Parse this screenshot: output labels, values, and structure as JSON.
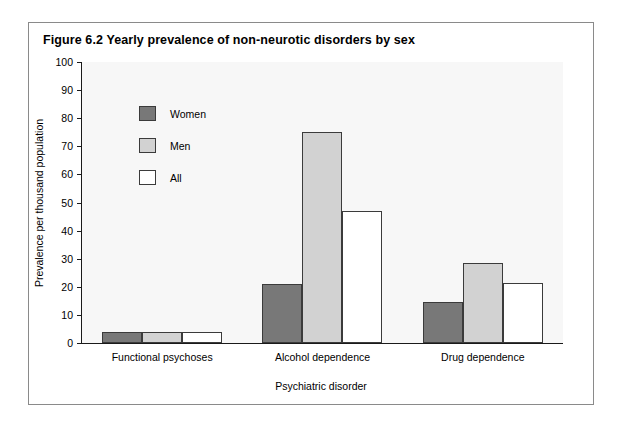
{
  "figure": {
    "title": "Figure 6.2  Yearly prevalence of non-neurotic disorders by sex"
  },
  "chart_data": {
    "type": "bar",
    "title": "Figure 6.2  Yearly prevalence of non-neurotic disorders by sex",
    "xlabel": "Psychiatric disorder",
    "ylabel": "Prevalence per thousand population",
    "categories": [
      "Functional psychoses",
      "Alcohol dependence",
      "Drug dependence"
    ],
    "series": [
      {
        "name": "Women",
        "color": "#787878",
        "values": [
          4,
          21,
          14.5
        ]
      },
      {
        "name": "Men",
        "color": "#d2d2d2",
        "values": [
          4,
          75,
          28.5
        ]
      },
      {
        "name": "All",
        "color": "#ffffff",
        "values": [
          4,
          47,
          21.5
        ]
      }
    ],
    "ylim": [
      0,
      100
    ],
    "yticks": [
      0,
      10,
      20,
      30,
      40,
      50,
      60,
      70,
      80,
      90,
      100
    ],
    "ytick_labels": [
      "0",
      "10",
      "20",
      "30",
      "40",
      "50",
      "60",
      "70",
      "80",
      "90",
      "100"
    ],
    "grid": false,
    "legend_position": "upper-left-inside"
  }
}
